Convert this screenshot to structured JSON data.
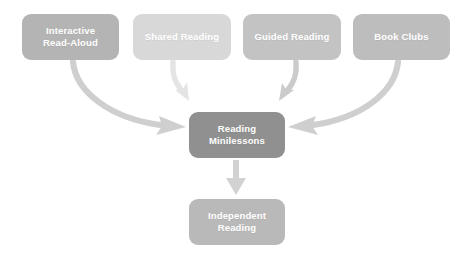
{
  "diagram": {
    "background_color": "#ffffff",
    "label_color": "#ffffff",
    "nodes": [
      {
        "id": "interactive-read-aloud",
        "label": "Interactive\nRead-Aloud",
        "color": "#b4b4b4",
        "x": 22,
        "y": 14,
        "w": 97,
        "h": 46
      },
      {
        "id": "shared-reading",
        "label": "Shared Reading",
        "color": "#d8d8d8",
        "x": 133,
        "y": 14,
        "w": 98,
        "h": 46
      },
      {
        "id": "guided-reading",
        "label": "Guided Reading",
        "color": "#c3c3c3",
        "x": 243,
        "y": 14,
        "w": 98,
        "h": 46
      },
      {
        "id": "book-clubs",
        "label": "Book Clubs",
        "color": "#bdbdbd",
        "x": 353,
        "y": 14,
        "w": 97,
        "h": 46
      },
      {
        "id": "reading-minilessons",
        "label": "Reading\nMinilessons",
        "color": "#909090",
        "x": 189,
        "y": 112,
        "w": 96,
        "h": 46
      },
      {
        "id": "independent-reading",
        "label": "Independent\nReading",
        "color": "#b9b9b9",
        "x": 189,
        "y": 199,
        "w": 96,
        "h": 46
      }
    ],
    "arrows": [
      {
        "id": "arrow-interactive-to-minilessons",
        "from": "interactive-read-aloud",
        "to": "reading-minilessons",
        "color": "#cfcfcf",
        "shape": "curved-right"
      },
      {
        "id": "arrow-shared-to-minilessons",
        "from": "shared-reading",
        "to": "reading-minilessons",
        "color": "#e2e2e2",
        "shape": "short-curve-down"
      },
      {
        "id": "arrow-guided-to-minilessons",
        "from": "guided-reading",
        "to": "reading-minilessons",
        "color": "#cbcbcb",
        "shape": "short-curve-down"
      },
      {
        "id": "arrow-bookclubs-to-minilessons",
        "from": "book-clubs",
        "to": "reading-minilessons",
        "color": "#cfcfcf",
        "shape": "curved-left"
      },
      {
        "id": "arrow-minilessons-to-independent",
        "from": "reading-minilessons",
        "to": "independent-reading",
        "color": "#d0d0d0",
        "shape": "straight-down"
      }
    ]
  }
}
